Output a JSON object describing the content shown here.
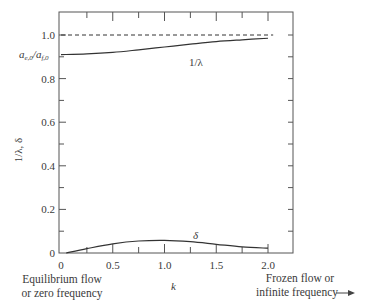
{
  "chart_data": {
    "type": "line",
    "title": "",
    "xlabel": "k",
    "ylabel": "1/λ, δ",
    "xlim": [
      0,
      2.0
    ],
    "ylim": [
      0,
      1.0
    ],
    "x_ticks": [
      "0",
      "0.5",
      "1.0",
      "1.5",
      "2.0"
    ],
    "y_ticks": [
      "0",
      "0.2",
      "0.4",
      "0.6",
      "0.8",
      "1.0"
    ],
    "grid": false,
    "series": [
      {
        "name": "1/λ",
        "style": "solid",
        "x": [
          0,
          0.25,
          0.5,
          0.75,
          1.0,
          1.25,
          1.5,
          1.75,
          2.0
        ],
        "y": [
          0.91,
          0.913,
          0.92,
          0.932,
          0.945,
          0.958,
          0.97,
          0.978,
          0.985
        ]
      },
      {
        "name": "δ",
        "style": "solid",
        "x": [
          0.05,
          0.25,
          0.5,
          0.75,
          1.0,
          1.25,
          1.5,
          1.75,
          2.0
        ],
        "y": [
          0.0,
          0.02,
          0.042,
          0.055,
          0.058,
          0.052,
          0.04,
          0.028,
          0.022
        ]
      },
      {
        "name": "1.0 reference",
        "style": "dashed",
        "x": [
          0,
          2.05
        ],
        "y": [
          1.0,
          1.0
        ]
      }
    ],
    "annotations": [
      {
        "text": "a_{e,0}/a_{f,0}",
        "at_y": 0.91,
        "position": "left of y-axis"
      },
      {
        "text": "1/λ",
        "near": "1/λ curve"
      },
      {
        "text": "δ",
        "near": "δ curve"
      },
      {
        "text": "Equilibrium flow or zero frequency",
        "position": "below k=0"
      },
      {
        "text": "Frozen flow or infinite frequency →",
        "position": "below k=2.0"
      }
    ]
  },
  "labels": {
    "y_axis": "1/λ, δ",
    "x_axis": "k",
    "ratio_label_main": "a",
    "ratio_label_sub1": "e,0",
    "ratio_label_sep": "/a",
    "ratio_label_sub2": "f,0",
    "curve_inv_lambda": "1/λ",
    "curve_delta": "δ",
    "left_note_line1": "Equilibrium flow",
    "left_note_line2": "or zero frequency",
    "right_note_line1": "Frozen flow or",
    "right_note_line2": "infinite frequency"
  }
}
